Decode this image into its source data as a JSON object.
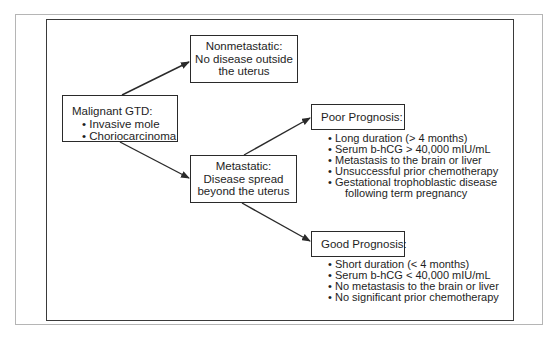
{
  "diagram": {
    "root": {
      "title": "Malignant GTD:",
      "items": [
        "Invasive mole",
        "Choriocarcinoma"
      ]
    },
    "nonmetastatic": {
      "lines": [
        "Nonmetastatic:",
        "No disease outside",
        "the uterus"
      ]
    },
    "metastatic": {
      "lines": [
        "Metastatic:",
        "Disease spread",
        "beyond the uterus"
      ]
    },
    "poor_prognosis": {
      "title": "Poor Prognosis:",
      "items": [
        "Long duration (> 4 months)",
        "Serum b-hCG > 40,000 mIU/mL",
        "Metastasis to the brain or liver",
        "Unsuccessful prior chemotherapy",
        "Gestational trophoblastic disease",
        "following term pregnancy"
      ]
    },
    "good_prognosis": {
      "title": "Good Prognosis:",
      "items": [
        "Short duration (< 4 months)",
        "Serum b-hCG < 40,000 mIU/mL",
        "No metastasis to the brain or liver",
        "No significant prior chemotherapy"
      ]
    },
    "bullet_glyph": "•",
    "colors": {
      "line": "#2a2a2a",
      "outer_frame": "#b5b5b5",
      "inner_frame": "#3a3a3a",
      "text": "#1e1e1e",
      "background": "#ffffff"
    }
  }
}
